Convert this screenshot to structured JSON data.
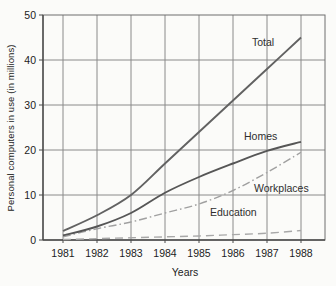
{
  "chart_data": {
    "type": "line",
    "title": "",
    "xlabel": "Years",
    "ylabel": "Personal computers in use (in millions)",
    "x": [
      1981,
      1982,
      1983,
      1984,
      1985,
      1986,
      1987,
      1988
    ],
    "ylim": [
      0,
      50
    ],
    "yticks": [
      0,
      10,
      20,
      30,
      40,
      50
    ],
    "grid": true,
    "legend_position": "inline-labels",
    "colors": {
      "grid": "#8a8a8a",
      "frame": "#6f6f6f",
      "axis": "#4a4a4a",
      "dark_line": "#595959",
      "light_line": "#a3a3a3"
    },
    "series": [
      {
        "name": "Total",
        "style": "solid",
        "color": "#626262",
        "values": [
          2,
          5.5,
          10,
          17,
          24,
          31,
          38,
          45
        ]
      },
      {
        "name": "Homes",
        "style": "solid",
        "color": "#565656",
        "values": [
          1,
          3,
          6,
          10.5,
          14,
          17,
          19.8,
          21.8
        ]
      },
      {
        "name": "Workplaces",
        "style": "dash-dot",
        "color": "#a0a0a0",
        "values": [
          0.7,
          2.5,
          4,
          6,
          8,
          11,
          15,
          19.5
        ]
      },
      {
        "name": "Education",
        "style": "dashed",
        "color": "#a8a8a8",
        "values": [
          0.1,
          0.3,
          0.5,
          0.7,
          0.9,
          1.2,
          1.5,
          2.1
        ]
      }
    ]
  }
}
